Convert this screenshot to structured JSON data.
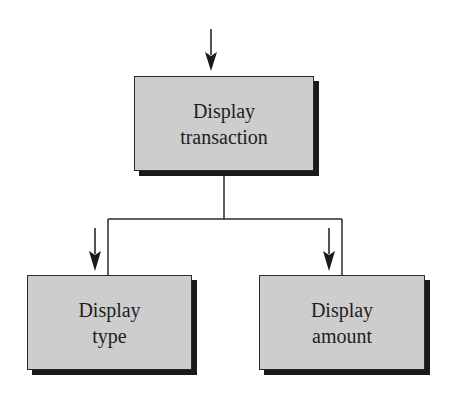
{
  "diagram": {
    "type": "structure-chart",
    "colors": {
      "node_fill": "#cdcdcd",
      "node_border": "#2a2a2a",
      "node_shadow": "#1a1a1a",
      "line": "#2a2a2a",
      "text": "#1e1e1e",
      "background": "#ffffff"
    },
    "nodes": [
      {
        "id": "display-transaction",
        "line1": "Display",
        "line2": "transaction",
        "level": 0
      },
      {
        "id": "display-type",
        "line1": "Display",
        "line2": "type",
        "level": 1,
        "parent": "display-transaction"
      },
      {
        "id": "display-amount",
        "line1": "Display",
        "line2": "amount",
        "level": 1,
        "parent": "display-transaction"
      }
    ],
    "edges": [
      {
        "from": "display-transaction",
        "to": "display-type"
      },
      {
        "from": "display-transaction",
        "to": "display-amount"
      }
    ],
    "entry_arrows": [
      {
        "target": "display-transaction",
        "direction": "down"
      },
      {
        "target": "display-type",
        "direction": "down"
      },
      {
        "target": "display-amount",
        "direction": "down"
      }
    ]
  }
}
